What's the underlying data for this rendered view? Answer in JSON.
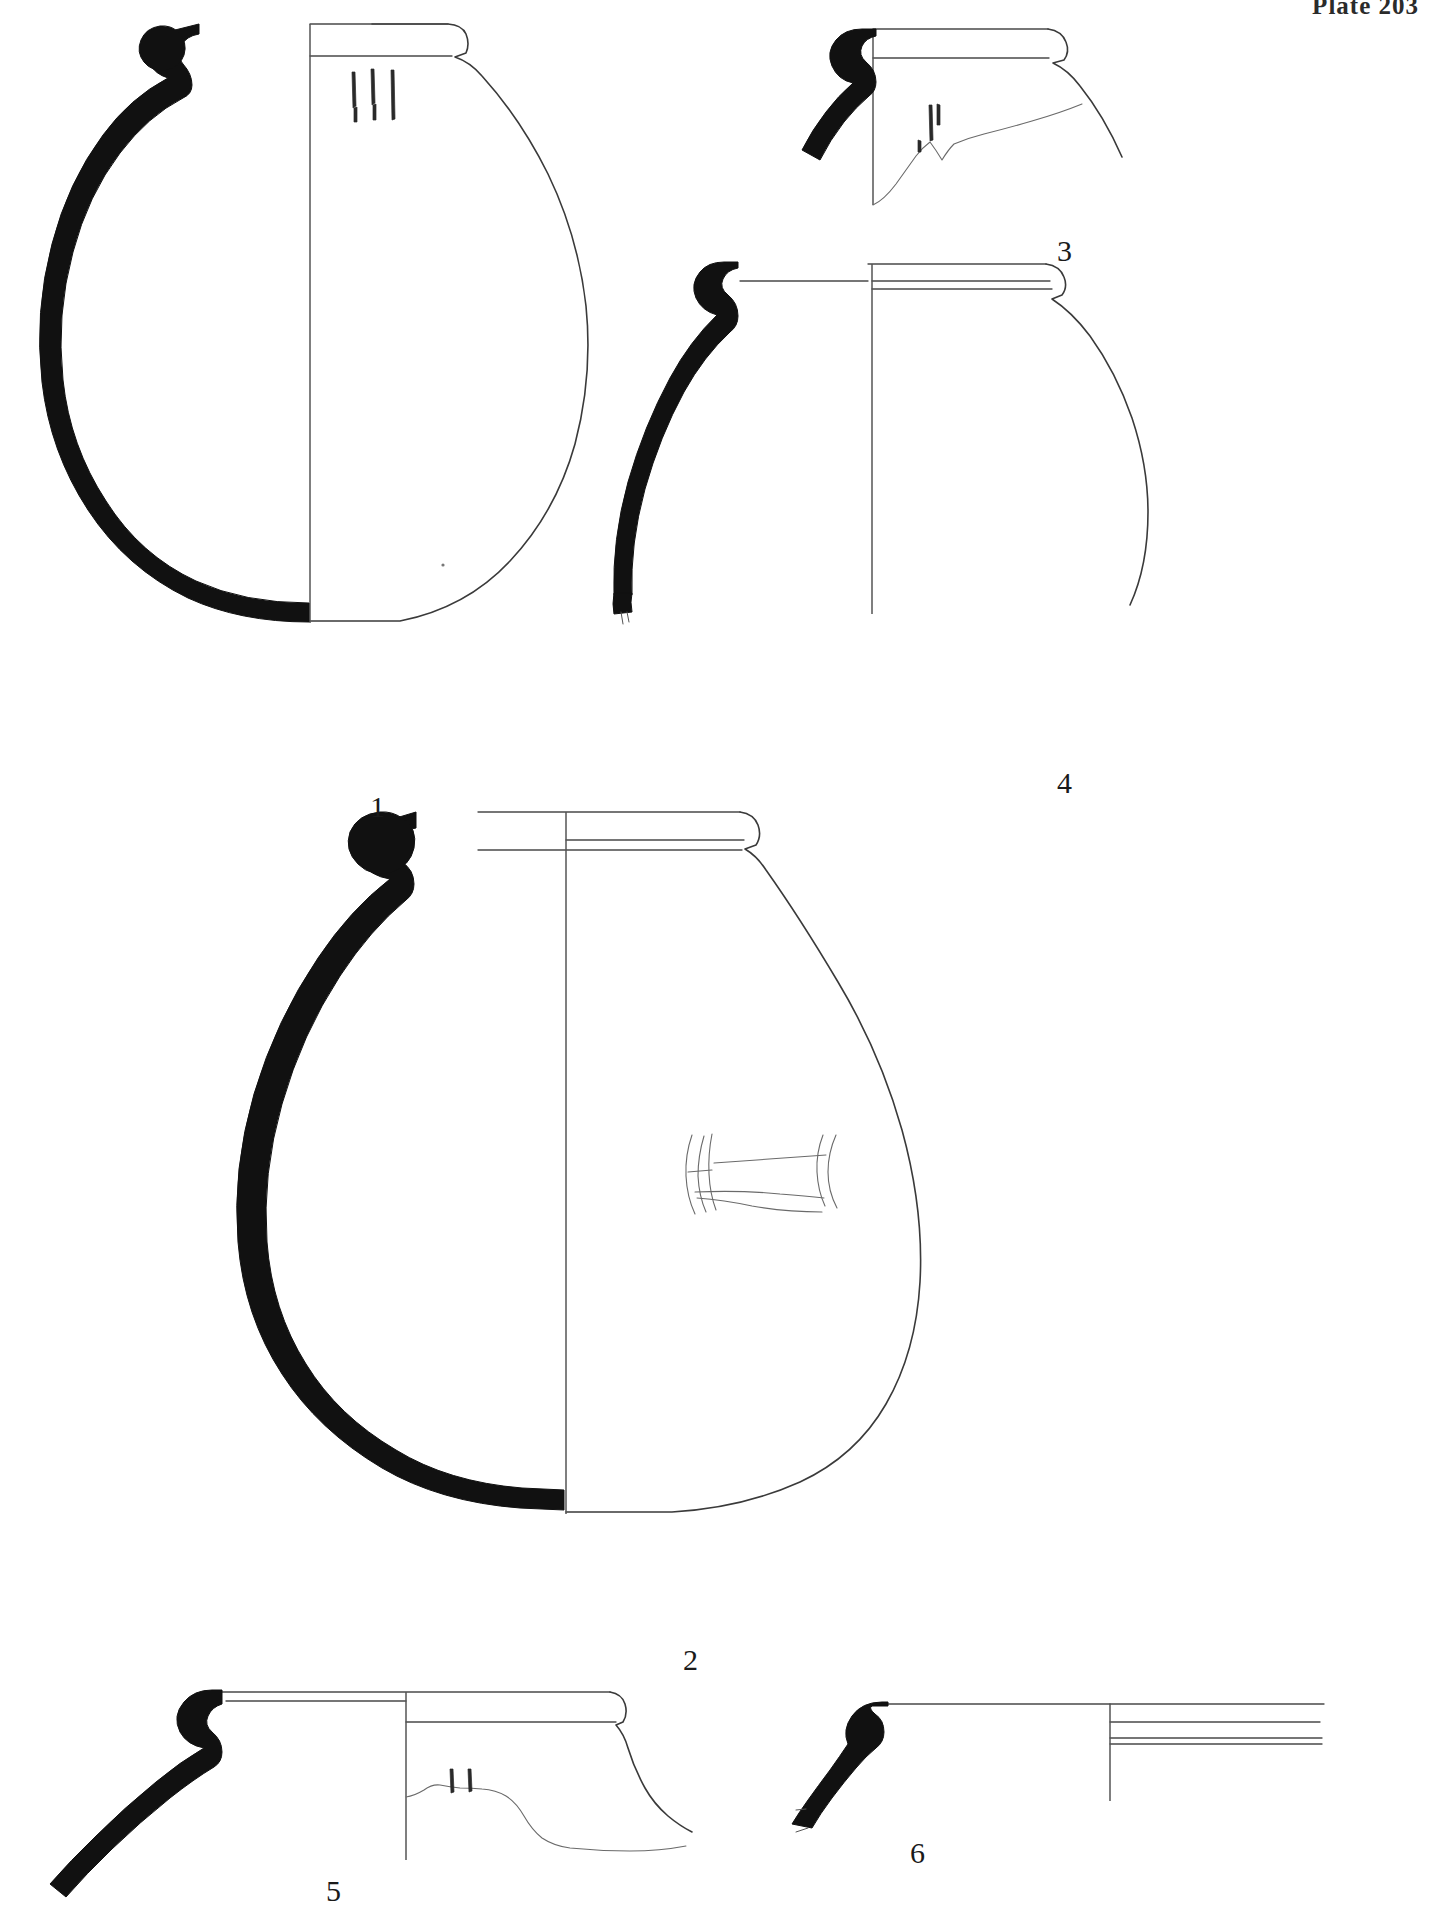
{
  "plate": {
    "header": "Plate 203",
    "background_color": "#ffffff",
    "ink_color": "#3a3a3a",
    "section_fill_color": "#111111",
    "width": 1429,
    "height": 1907
  },
  "figures": [
    {
      "id": "fig-1",
      "label": "1",
      "label_x": 370,
      "label_y": 792,
      "type": "complete-profile-jar",
      "description": "Large globular jar, full profile, half section blacked, everted rim, three short vertical incised strokes on shoulder",
      "decoration": "three vertical incised strokes",
      "decoration_count": 3
    },
    {
      "id": "fig-2",
      "label": "2",
      "label_x": 683,
      "label_y": 1645,
      "type": "complete-profile-jar",
      "description": "Large ovoid jar, full profile, half section blacked, thickened rim, rectangular impressed band on body",
      "decoration": "rectangular impressed panel",
      "decoration_count": 1
    },
    {
      "id": "fig-3",
      "label": "3",
      "label_x": 1057,
      "label_y": 236,
      "type": "rim-sherd",
      "description": "Rim sherd with flat everted rim, blacked section, irregular broken lower edge with small incised marks",
      "decoration": "short incised strokes",
      "decoration_count": 3
    },
    {
      "id": "fig-4",
      "label": "4",
      "label_x": 1057,
      "label_y": 768,
      "type": "partial-profile-jar",
      "description": "Upper body of a large jar, flattened rim, blacked section, body wall curving to lower right",
      "decoration": "none",
      "decoration_count": 0
    },
    {
      "id": "fig-5",
      "label": "5",
      "label_x": 326,
      "label_y": 1876,
      "type": "rim-sherd",
      "description": "Rim sherd with narrow flat rim, blacked section, stepped profile and uneven broken edge with two small incised marks",
      "decoration": "two short incised strokes",
      "decoration_count": 2
    },
    {
      "id": "fig-6",
      "label": "6",
      "label_x": 910,
      "label_y": 1838,
      "type": "rim-sherd",
      "description": "Small rim sherd, blacked section, straight rim with parallel horizontal interior lines",
      "decoration": "none",
      "decoration_count": 0
    }
  ]
}
